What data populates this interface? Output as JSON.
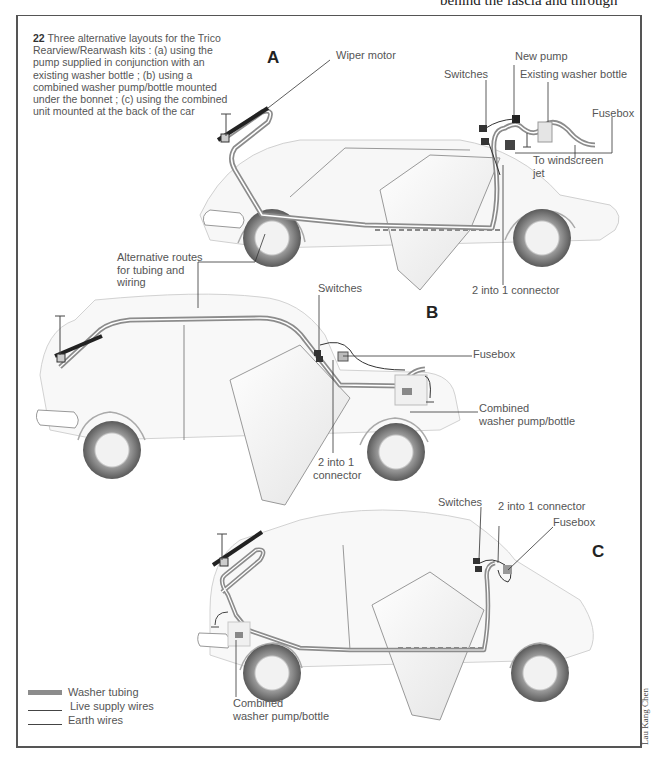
{
  "page": {
    "top_cut_text": "behind the fascia and through",
    "credit": "Lau Kang Chen"
  },
  "caption": {
    "number": "22",
    "text": " Three alternative layouts for the Trico Rearview/Rearwash kits : (a) using the pump supplied in conjunction with an existing washer bottle ; (b) using a combined washer pump/bottle mounted under the bonnet ; (c) using the combined unit mounted at the back of the car"
  },
  "diagram_a": {
    "letter": "A",
    "labels": {
      "wiper_motor": "Wiper motor",
      "new_pump": "New pump",
      "switches": "Switches",
      "existing_washer_bottle": "Existing washer bottle",
      "fusebox": "Fusebox",
      "to_windscreen_jet_1": "To windscreen",
      "to_windscreen_jet_2": "jet",
      "two_into_one": "2 into 1 connector"
    }
  },
  "diagram_b": {
    "letter": "B",
    "labels": {
      "alt_routes_1": "Alternative routes",
      "alt_routes_2": "for tubing and",
      "alt_routes_3": "wiring",
      "switches": "Switches",
      "fusebox": "Fusebox",
      "combined_1": "Combined",
      "combined_2": "washer pump/bottle",
      "two_into_one_1": "2 into 1",
      "two_into_one_2": "connector"
    }
  },
  "diagram_c": {
    "letter": "C",
    "labels": {
      "switches": "Switches",
      "two_into_one": "2 into 1 connector",
      "fusebox": "Fusebox",
      "combined_1": "Combined",
      "combined_2": "washer pump/bottle"
    }
  },
  "legend": {
    "items": [
      {
        "label": "Washer tubing",
        "color": "#8c8c8c",
        "thickness": 5
      },
      {
        "label": "Live supply wires",
        "color": "#444444",
        "thickness": 1
      },
      {
        "label": "Earth wires",
        "color": "#444444",
        "thickness": 1
      }
    ]
  },
  "colors": {
    "tubing": "#8c8c8c",
    "wire": "#333333",
    "body_outline": "#bdbdbd",
    "tyre": "#6e6e6e"
  }
}
